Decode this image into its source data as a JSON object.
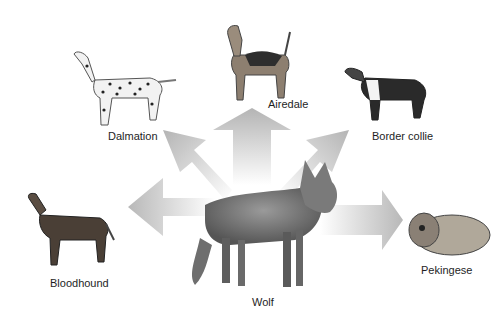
{
  "diagram": {
    "center": {
      "id": "wolf",
      "label": "Wolf"
    },
    "breeds": [
      {
        "id": "dalmation",
        "label": "Dalmation"
      },
      {
        "id": "airedale",
        "label": "Airedale"
      },
      {
        "id": "border-collie",
        "label": "Border collie"
      },
      {
        "id": "bloodhound",
        "label": "Bloodhound"
      },
      {
        "id": "pekingese",
        "label": "Pekingese"
      }
    ],
    "arrow_color": "#bdbdbd"
  }
}
